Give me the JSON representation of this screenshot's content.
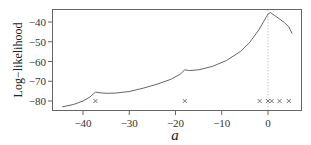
{
  "chart_data": {
    "type": "line",
    "title": "",
    "xlabel": "a",
    "ylabel": "Log−likelihood",
    "xlim": [
      -45.5,
      7.3
    ],
    "ylim": [
      -84.5,
      -33.5
    ],
    "xticks": [
      -40,
      -30,
      -20,
      -10,
      0
    ],
    "xtick_labels": [
      "−40",
      "−30",
      "−20",
      "−10",
      "0"
    ],
    "yticks": [
      -40,
      -50,
      -60,
      -70,
      -80
    ],
    "ytick_labels": [
      "−40",
      "−50",
      "−60",
      "−70",
      "−80"
    ],
    "grid": false,
    "legend": null,
    "series": [
      {
        "name": "log-likelihood",
        "kind": "line",
        "color": "#555555",
        "x": [
          -44.5,
          -42,
          -40,
          -38.5,
          -37.3,
          -36.5,
          -35,
          -33,
          -30,
          -27,
          -24,
          -21,
          -19,
          -18,
          -17,
          -15,
          -12,
          -9,
          -6,
          -4,
          -2,
          -1,
          -0.3,
          0,
          0.5,
          1.5,
          2.5,
          3.5,
          4.5,
          5.2
        ],
        "y": [
          -83,
          -81.7,
          -80,
          -78,
          -75.5,
          -75.8,
          -76.1,
          -76,
          -75.2,
          -73.5,
          -71.5,
          -69,
          -66.5,
          -64.2,
          -64.6,
          -64.2,
          -62.5,
          -59.5,
          -55,
          -50.5,
          -44,
          -40,
          -37.2,
          -36,
          -35.2,
          -36.8,
          -38.5,
          -40.2,
          -42.5,
          -45.8
        ]
      },
      {
        "name": "data points",
        "kind": "scatter",
        "marker": "x",
        "color": "#555555",
        "x": [
          -37.3,
          -18,
          -1.8,
          0,
          0.8,
          2.5,
          4.5
        ],
        "y": [
          -80,
          -80,
          -80,
          -80,
          -80,
          -80,
          -80
        ]
      }
    ],
    "annotations": [
      {
        "kind": "vline",
        "x": 0,
        "style": "dotted",
        "color": "#bbbbbb"
      }
    ]
  }
}
